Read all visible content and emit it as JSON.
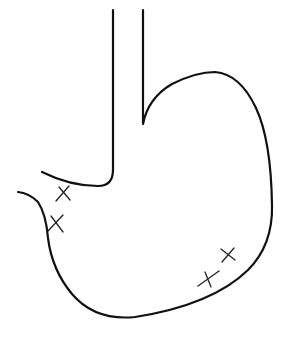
{
  "diagram": {
    "parts": [
      "esophagus",
      "fundus",
      "greater-curvature",
      "lesser-curvature",
      "pylorus"
    ],
    "markers": {
      "symbol": "×",
      "count": 4,
      "locations": [
        "lesser-curvature-upper",
        "lesser-curvature-lower",
        "greater-curvature-upper",
        "greater-curvature-lower"
      ]
    },
    "colors": {
      "line": "#111111",
      "background": "#ffffff"
    }
  }
}
